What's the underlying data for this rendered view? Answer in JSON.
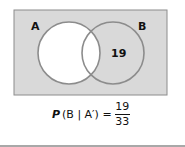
{
  "diagram": {
    "type": "venn",
    "sets": [
      {
        "label": "A"
      },
      {
        "label": "B"
      }
    ],
    "regions": {
      "B_only": "19"
    },
    "shaded": "complement of A",
    "colors": {
      "shade": "#d9d9d9",
      "outline": "#8c8c8c",
      "frame": "#8c8c8c"
    }
  },
  "formula": {
    "lhs_p": "P",
    "lhs_args": "(B | A′) =",
    "numerator": "19",
    "denominator": "33"
  }
}
